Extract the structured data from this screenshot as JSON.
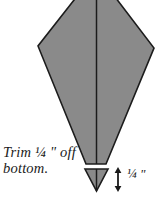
{
  "diagram": {
    "colors": {
      "shape_fill": "#8a8a8a",
      "shape_outline": "#1c1c1c",
      "seam_line": "#1c1c1c",
      "background": "#ffffff",
      "text": "#1a1a1a",
      "arrow": "#1a1a1a"
    },
    "annotations": {
      "trim_instruction_line1": "Trim ¼ \" off",
      "trim_instruction_line2": "bottom.",
      "measure_label": "¼ \""
    },
    "shapes": {
      "kite_main": {
        "name": "kite-body",
        "description": "Large gray kite / diamond with truncated flat bottom, apex cropped at top edge",
        "points": "96,-28 38,46 86,164 106,164 154,48"
      },
      "kite_seam": {
        "name": "center-seam-line",
        "description": "Vertical seam line down the center of the kite body",
        "x": 96.5,
        "y1": -28,
        "y2": 164
      },
      "trim_piece": {
        "name": "trim-triangle",
        "description": "Detached small gray triangle removed from the bottom",
        "points": "85,169 108,169 96.5,191"
      },
      "trim_piece_seam": {
        "name": "trim-triangle-seam-line",
        "x": 96.5,
        "y1": 169,
        "y2": 191
      }
    },
    "measure_arrow": {
      "name": "quarter-inch-dimension-arrow",
      "x": 118,
      "y_top": 168,
      "y_bottom": 191
    }
  }
}
